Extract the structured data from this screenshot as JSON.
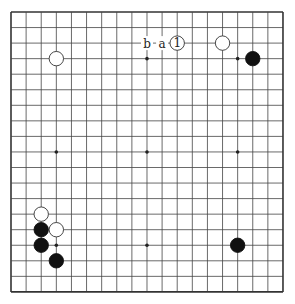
{
  "board": {
    "size": 19,
    "grid": {
      "x0": 11,
      "y0": 12,
      "dx": 15.11,
      "dy": 15.55
    },
    "line_color": "#444444",
    "border_color": "#333333",
    "star_points": [
      [
        3,
        3
      ],
      [
        9,
        3
      ],
      [
        15,
        3
      ],
      [
        3,
        9
      ],
      [
        9,
        9
      ],
      [
        15,
        9
      ],
      [
        3,
        15
      ],
      [
        9,
        15
      ],
      [
        15,
        15
      ]
    ],
    "stones": [
      {
        "color": "white",
        "col": 3,
        "row": 3
      },
      {
        "color": "white",
        "col": 11,
        "row": 2,
        "label": "1"
      },
      {
        "color": "white",
        "col": 14,
        "row": 2
      },
      {
        "color": "black",
        "col": 16,
        "row": 3
      },
      {
        "color": "white",
        "col": 2,
        "row": 13
      },
      {
        "color": "black",
        "col": 2,
        "row": 14
      },
      {
        "color": "white",
        "col": 3,
        "row": 14
      },
      {
        "color": "black",
        "col": 2,
        "row": 15
      },
      {
        "color": "black",
        "col": 3,
        "row": 16
      },
      {
        "color": "black",
        "col": 15,
        "row": 15
      }
    ],
    "point_labels": [
      {
        "text": "b",
        "col": 9,
        "row": 2
      },
      {
        "text": "a",
        "col": 10,
        "row": 2
      }
    ]
  }
}
